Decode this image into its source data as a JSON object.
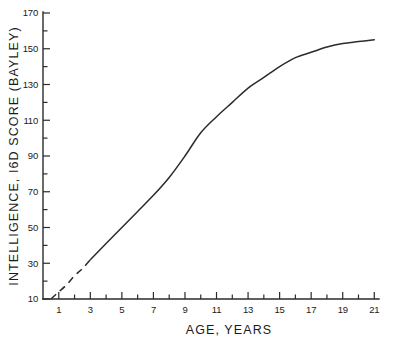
{
  "chart_data": {
    "type": "line",
    "title": "",
    "xlabel": "AGE, YEARS",
    "ylabel": "INTELLIGENCE, I6D SCORE (BAYLEY)",
    "xlim": [
      0,
      21.3
    ],
    "ylim": [
      0,
      170
    ],
    "grid": false,
    "legend": "none",
    "x_ticks_labeled": [
      1,
      3,
      5,
      7,
      9,
      11,
      13,
      15,
      17,
      19,
      21
    ],
    "x_ticks_minor": [
      2,
      4,
      6,
      8,
      10,
      12,
      14,
      16,
      18,
      20
    ],
    "y_ticks_labeled": [
      10,
      30,
      50,
      70,
      90,
      110,
      130,
      150,
      170
    ],
    "y_ticks_minor": [
      20,
      40,
      60,
      80,
      100,
      120,
      140,
      160
    ],
    "series": [
      {
        "name": "Estimated (extrapolated)",
        "style": "dashed",
        "x": [
          0.5,
          1.0,
          1.5,
          2.0,
          2.5,
          3.0
        ],
        "values": [
          10,
          14,
          18,
          23,
          27,
          32
        ]
      },
      {
        "name": "Measured intelligence",
        "style": "solid",
        "x": [
          3.0,
          4.0,
          5.0,
          6.0,
          7.0,
          8.0,
          9.0,
          10.0,
          11.0,
          12.0,
          13.0,
          14.0,
          15.0,
          16.0,
          17.0,
          18.0,
          19.0,
          20.0,
          21.0
        ],
        "values": [
          32,
          41,
          50,
          59,
          68,
          78,
          90,
          103,
          112,
          120,
          128,
          134,
          140,
          145,
          148,
          151,
          153,
          154,
          155
        ]
      }
    ]
  },
  "axes": {
    "y_label_text": "INTELLIGENCE, I6D SCORE (BAYLEY)",
    "x_label_text": "AGE, YEARS",
    "y_tick_labels": [
      "170",
      "150",
      "130",
      "110",
      "90",
      "70",
      "50",
      "30",
      "10"
    ],
    "x_tick_labels": [
      "1",
      "3",
      "5",
      "7",
      "9",
      "11",
      "13",
      "15",
      "17",
      "19",
      "21"
    ]
  },
  "style": {
    "ink_color": "#2b2b2b",
    "background": "#ffffff"
  }
}
